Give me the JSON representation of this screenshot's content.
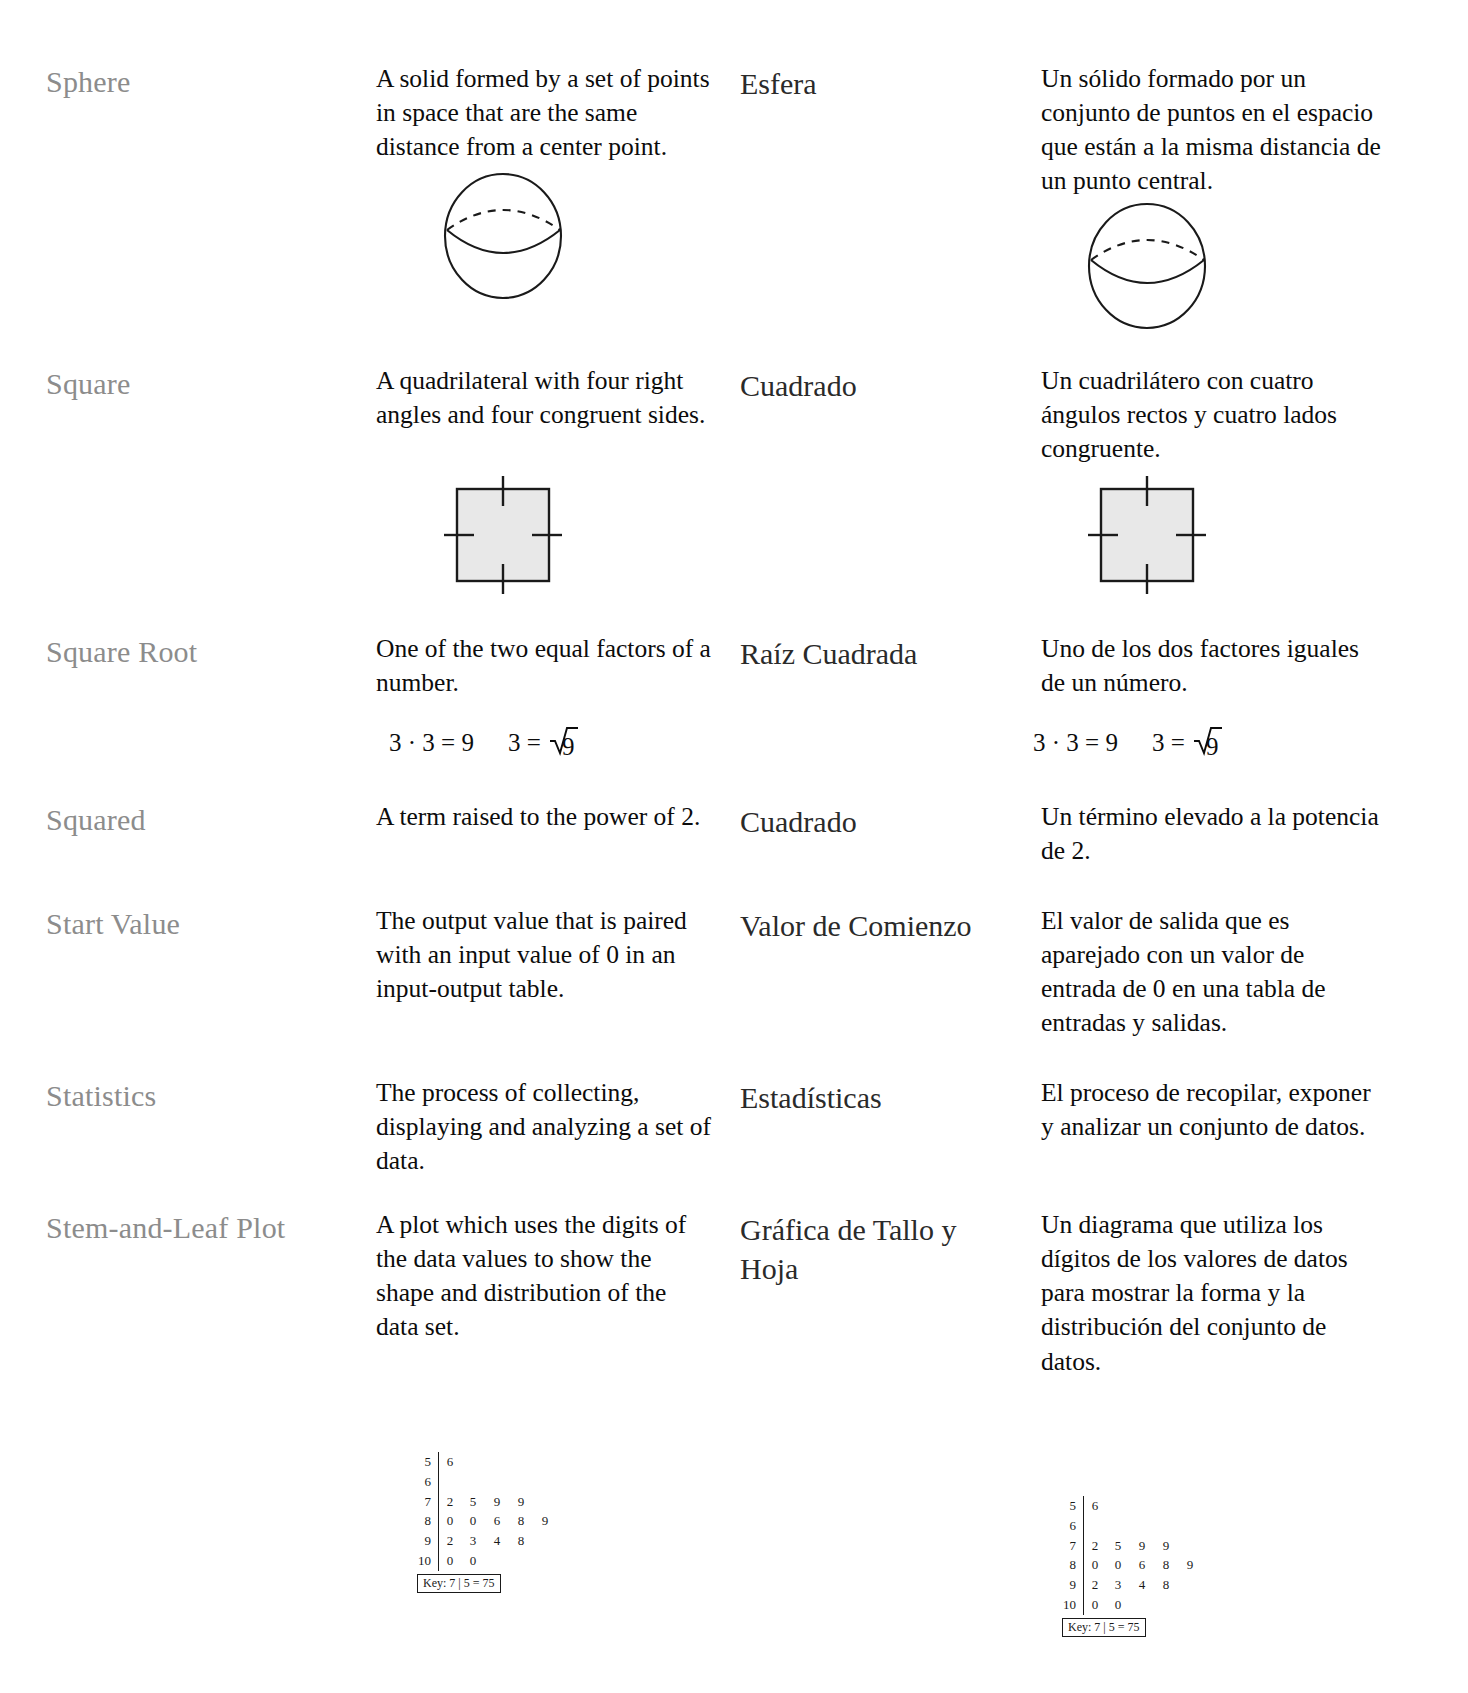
{
  "document": {
    "type": "bilingual-math-glossary",
    "languages": [
      "English",
      "Spanish"
    ],
    "colors": {
      "term_english": "#8c8c8c",
      "term_spanish": "#2a2a2a",
      "definition": "#0c0c0c",
      "figure_stroke": "#1a1a1a",
      "square_fill": "#e8e8e8",
      "page_background": "#ffffff"
    }
  },
  "entries": [
    {
      "term_en": "Sphere",
      "definition_en": "A solid formed by a set of points in space that are the same distance from a center point.",
      "term_es": "Esfera",
      "definition_es": "Un sólido formado por un conjunto de puntos en el espacio que están a la misma distancia de un punto central.",
      "figure": "sphere-diagram"
    },
    {
      "term_en": "Square",
      "definition_en": "A quadrilateral with four right angles and four congruent sides.",
      "term_es": "Cuadrado",
      "definition_es": "Un cuadrilátero con cuatro ángulos rectos y cuatro lados congruente.",
      "figure": "square-diagram"
    },
    {
      "term_en": "Square Root",
      "definition_en": "One of the two equal factors of a number.",
      "term_es": "Raíz Cuadrada",
      "definition_es": "Uno de los dos factores iguales de un número.",
      "figure": "square-root-equation"
    },
    {
      "term_en": "Squared",
      "definition_en": "A term raised to the power of 2.",
      "term_es": "Cuadrado",
      "definition_es": "Un término elevado a la potencia de 2.",
      "figure": null
    },
    {
      "term_en": "Start Value",
      "definition_en": "The output value that is paired with an input value of 0 in an input-output table.",
      "term_es": "Valor de Comienzo",
      "definition_es": "El valor de salida que es aparejado con un valor de entrada de 0 en una tabla de entradas y salidas.",
      "figure": null
    },
    {
      "term_en": "Statistics",
      "definition_en": "The process of collecting, displaying and analyzing a set of data.",
      "term_es": "Estadísticas",
      "definition_es": "El proceso de recopilar, exponer y analizar un conjunto de datos.",
      "figure": null
    },
    {
      "term_en": "Stem-and-Leaf Plot",
      "definition_en": "A plot which uses the digits of the data values to show the shape and distribution of the data set.",
      "term_es": "Gráfica de Tallo y Hoja",
      "definition_es": "Un diagrama que utiliza los dígitos de los valores de datos para mostrar la forma y la distribución del conjunto de datos.",
      "figure": "stem-and-leaf-plot"
    }
  ],
  "equation": {
    "left": "3 · 3 = 9",
    "right_prefix": "3 = ",
    "radicand": "9"
  },
  "stem_and_leaf": {
    "rows": [
      {
        "stem": "5",
        "leaves": [
          "6"
        ]
      },
      {
        "stem": "6",
        "leaves": []
      },
      {
        "stem": "7",
        "leaves": [
          "2",
          "5",
          "9",
          "9"
        ]
      },
      {
        "stem": "8",
        "leaves": [
          "0",
          "0",
          "6",
          "8",
          "9"
        ]
      },
      {
        "stem": "9",
        "leaves": [
          "2",
          "3",
          "4",
          "8"
        ]
      },
      {
        "stem": "10",
        "leaves": [
          "0",
          "0"
        ]
      }
    ],
    "key": "Key: 7 | 5 = 75"
  }
}
